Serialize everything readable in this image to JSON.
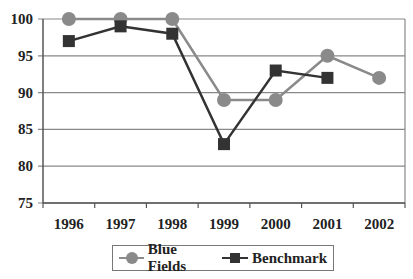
{
  "chart_data": {
    "type": "line",
    "title": "",
    "xlabel": "",
    "ylabel": "",
    "categories": [
      "1996",
      "1997",
      "1998",
      "1999",
      "2000",
      "2001",
      "2002"
    ],
    "ylim": [
      75,
      100
    ],
    "yticks": [
      75,
      80,
      85,
      90,
      95,
      100
    ],
    "grid": true,
    "legend_position": "bottom",
    "series": [
      {
        "name": "Blue Fields",
        "marker": "circle",
        "color": "#8a8a8a",
        "values": [
          100,
          100,
          100,
          89,
          89,
          95,
          92
        ]
      },
      {
        "name": "Benchmark",
        "marker": "square",
        "color": "#333333",
        "values": [
          97,
          99,
          98,
          83,
          93,
          92,
          null
        ]
      }
    ]
  },
  "legend": {
    "items": [
      {
        "label": "Blue Fields"
      },
      {
        "label": "Benchmark"
      }
    ]
  },
  "axes": {
    "y_labels": [
      "100",
      "95",
      "90",
      "85",
      "80",
      "75"
    ],
    "x_labels": [
      "1996",
      "1997",
      "1998",
      "1999",
      "2000",
      "2001",
      "2002"
    ]
  }
}
